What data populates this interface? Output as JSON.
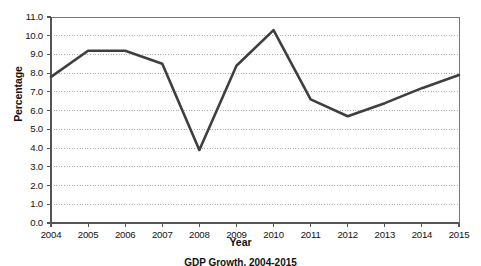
{
  "chart_data": {
    "type": "line",
    "title": "",
    "caption": "GDP Growth, 2004-2015",
    "xlabel": "Year",
    "ylabel": "Percentage",
    "categories": [
      "2004",
      "2005",
      "2006",
      "2007",
      "2008",
      "2009",
      "2010",
      "2011",
      "2012",
      "2013",
      "2014",
      "2015"
    ],
    "values": [
      7.8,
      9.2,
      9.2,
      8.5,
      3.9,
      8.4,
      10.3,
      6.6,
      5.7,
      6.4,
      7.2,
      7.9
    ],
    "series": [
      {
        "name": "Percentage",
        "values": [
          7.8,
          9.2,
          9.2,
          8.5,
          3.9,
          8.4,
          10.3,
          6.6,
          5.7,
          6.4,
          7.2,
          7.9
        ]
      }
    ],
    "ylim": [
      0.0,
      11.0
    ],
    "ytick_labels": [
      "0.0",
      "1.0",
      "2.0",
      "3.0",
      "4.0",
      "5.0",
      "6.0",
      "7.0",
      "8.0",
      "9.0",
      "10.0",
      "11.0"
    ],
    "xtick_labels": [
      "2004",
      "2005",
      "2006",
      "2007",
      "2008",
      "2009",
      "2010",
      "2011",
      "2012",
      "2013",
      "2014",
      "2015"
    ],
    "grid": "horizontal-dotted",
    "legend": "none",
    "line_color": "#3f3f3f",
    "grid_color": "#9a9a9a",
    "axis_color": "#6b6b6b"
  },
  "axes": {
    "ylabel": "Percentage",
    "xlabel": "Year",
    "yticks": [
      "11.0",
      "10.0",
      "9.0",
      "8.0",
      "7.0",
      "6.0",
      "5.0",
      "4.0",
      "3.0",
      "2.0",
      "1.0",
      "0.0"
    ],
    "xticks": [
      "2004",
      "2005",
      "2006",
      "2007",
      "2008",
      "2009",
      "2010",
      "2011",
      "2012",
      "2013",
      "2014",
      "2015"
    ]
  },
  "caption": {
    "text": "GDP Growth, 2004-2015"
  }
}
